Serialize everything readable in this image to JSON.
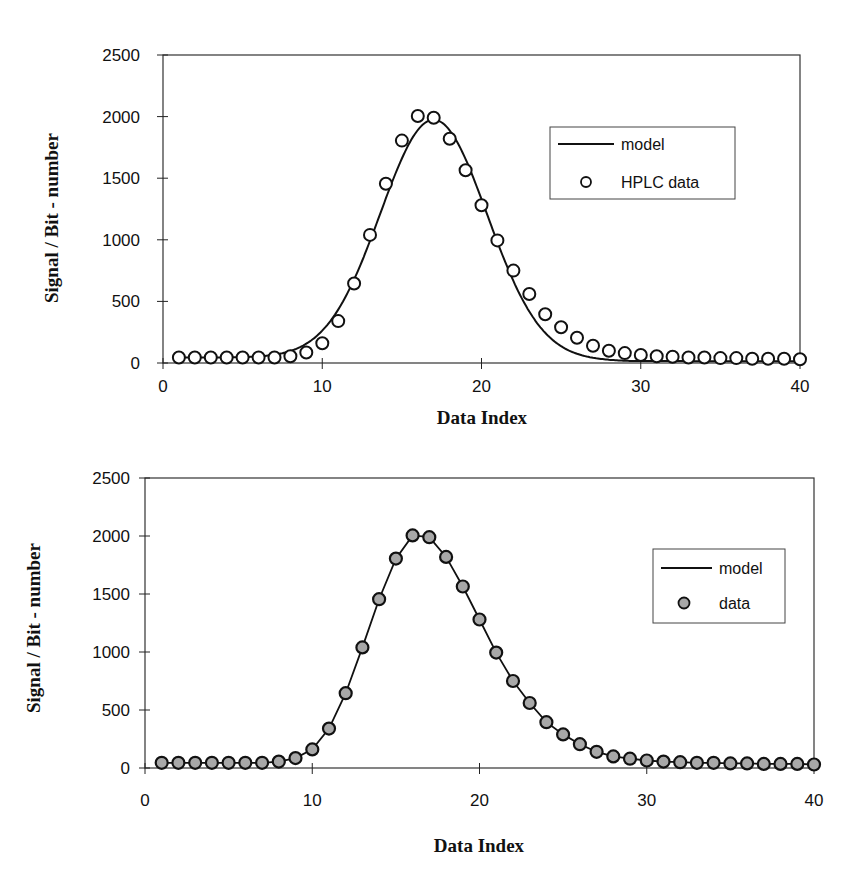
{
  "chart_data": [
    {
      "type": "scatter",
      "title": "",
      "xlabel": "Data Index",
      "ylabel": "Signal / Bit - number",
      "xlim": [
        0,
        40
      ],
      "ylim": [
        0,
        2500
      ],
      "xticks": [
        "0",
        "10",
        "20",
        "30",
        "40"
      ],
      "yticks": [
        "0",
        "500",
        "1000",
        "1500",
        "2000",
        "2500"
      ],
      "grid": false,
      "legend_position": "upper right",
      "legend": [
        "model",
        "HPLC data"
      ],
      "series": [
        {
          "name": "model",
          "kind": "line",
          "description": "Gaussian fit",
          "gaussian": {
            "amplitude": 1930,
            "center": 17.0,
            "sigma": 3.35,
            "baseline_left": 45,
            "baseline_right": 15
          }
        },
        {
          "name": "HPLC data",
          "kind": "markers",
          "marker": "open-circle",
          "x": [
            1,
            2,
            3,
            4,
            5,
            6,
            7,
            8,
            9,
            10,
            11,
            12,
            13,
            14,
            15,
            16,
            17,
            18,
            19,
            20,
            21,
            22,
            23,
            24,
            25,
            26,
            27,
            28,
            29,
            30,
            31,
            32,
            33,
            34,
            35,
            36,
            37,
            38,
            39,
            40
          ],
          "y": [
            45,
            45,
            45,
            45,
            45,
            45,
            45,
            55,
            85,
            160,
            340,
            645,
            1040,
            1455,
            1805,
            2005,
            1990,
            1820,
            1565,
            1280,
            995,
            750,
            560,
            395,
            290,
            205,
            140,
            100,
            80,
            65,
            55,
            50,
            45,
            45,
            40,
            40,
            35,
            35,
            35,
            30
          ]
        }
      ]
    },
    {
      "type": "line",
      "title": "",
      "xlabel": "Data Index",
      "ylabel": "Signal / Bit - number",
      "xlim": [
        0,
        40
      ],
      "ylim": [
        0,
        2500
      ],
      "xticks": [
        "0",
        "10",
        "20",
        "30",
        "40"
      ],
      "yticks": [
        "0",
        "500",
        "1000",
        "1500",
        "2000",
        "2500"
      ],
      "grid": false,
      "legend_position": "right",
      "legend": [
        "model",
        "data"
      ],
      "series": [
        {
          "name": "model",
          "kind": "line",
          "x": [
            1,
            2,
            3,
            4,
            5,
            6,
            7,
            8,
            9,
            10,
            11,
            12,
            13,
            14,
            15,
            16,
            17,
            18,
            19,
            20,
            21,
            22,
            23,
            24,
            25,
            26,
            27,
            28,
            29,
            30,
            31,
            32,
            33,
            34,
            35,
            36,
            37,
            38,
            39,
            40
          ],
          "y": [
            45,
            45,
            45,
            45,
            45,
            45,
            45,
            55,
            85,
            160,
            340,
            645,
            1040,
            1455,
            1805,
            2005,
            1990,
            1820,
            1565,
            1280,
            995,
            750,
            560,
            395,
            290,
            205,
            140,
            100,
            80,
            65,
            55,
            50,
            45,
            45,
            40,
            40,
            35,
            35,
            35,
            30
          ]
        },
        {
          "name": "data",
          "kind": "markers",
          "marker": "filled-gray-circle",
          "x": [
            1,
            2,
            3,
            4,
            5,
            6,
            7,
            8,
            9,
            10,
            11,
            12,
            13,
            14,
            15,
            16,
            17,
            18,
            19,
            20,
            21,
            22,
            23,
            24,
            25,
            26,
            27,
            28,
            29,
            30,
            31,
            32,
            33,
            34,
            35,
            36,
            37,
            38,
            39,
            40
          ],
          "y": [
            45,
            45,
            45,
            45,
            45,
            45,
            45,
            55,
            85,
            160,
            340,
            645,
            1040,
            1455,
            1805,
            2005,
            1990,
            1820,
            1565,
            1280,
            995,
            750,
            560,
            395,
            290,
            205,
            140,
            100,
            80,
            65,
            55,
            50,
            45,
            45,
            40,
            40,
            35,
            35,
            35,
            30
          ]
        }
      ]
    }
  ],
  "charts": [
    {
      "xlabel": "Data Index",
      "ylabel": "Signal / Bit - number",
      "legend_model": "model",
      "legend_data": "HPLC data"
    },
    {
      "xlabel": "Data Index",
      "ylabel": "Signal / Bit - number",
      "legend_model": "model",
      "legend_data": "data"
    }
  ],
  "colors": {
    "axis": "#222222",
    "line": "#111111",
    "marker_fill_open": "#ffffff",
    "marker_fill_gray": "#a8a8a8"
  }
}
